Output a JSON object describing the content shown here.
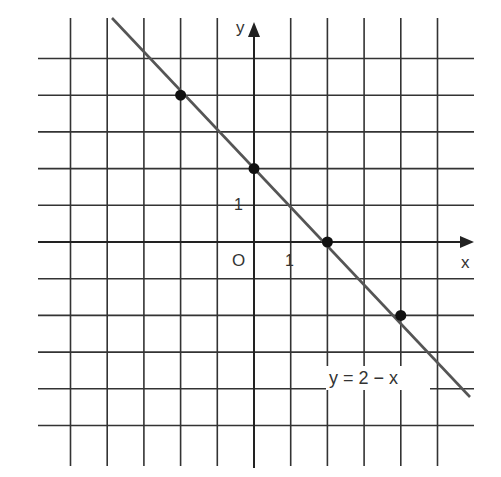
{
  "diagram": {
    "type": "coordinate-grid-line-graph",
    "equation_label": "y = 2 − x",
    "axis_labels": {
      "x": "x",
      "y": "y",
      "origin": "O"
    },
    "tick_labels": {
      "x_unit": "1",
      "y_unit": "1"
    },
    "grid": {
      "x_min": -5,
      "x_max": 5,
      "y_min": -5,
      "y_max": 5
    },
    "line": {
      "slope": -1,
      "intercept": 2,
      "from": [
        -3.9,
        6.2
      ],
      "to": [
        5.8,
        -4.1
      ]
    },
    "points": [
      {
        "x": -2,
        "y": 4
      },
      {
        "x": 0,
        "y": 2
      },
      {
        "x": 2,
        "y": 0
      },
      {
        "x": 4,
        "y": -2
      }
    ],
    "colors": {
      "grid": "#333333",
      "line": "#555555",
      "point": "#111111",
      "text": "#333333"
    }
  },
  "chart_data": {
    "type": "line",
    "title": "y = 2 − x",
    "xlabel": "x",
    "ylabel": "y",
    "series": [
      {
        "name": "y = 2 − x",
        "x": [
          -2,
          0,
          2,
          4
        ],
        "values": [
          4,
          2,
          0,
          -2
        ]
      }
    ],
    "xlim": [
      -5,
      6
    ],
    "ylim": [
      -5,
      6
    ],
    "grid": true,
    "tick_labels": {
      "x": [
        "1"
      ],
      "y": [
        "1"
      ]
    }
  }
}
